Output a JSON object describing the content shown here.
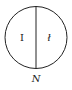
{
  "diagram": {
    "left_label": "I",
    "right_label": "ł",
    "caption": "N",
    "stroke_color": "#222222",
    "background": "#ffffff"
  }
}
